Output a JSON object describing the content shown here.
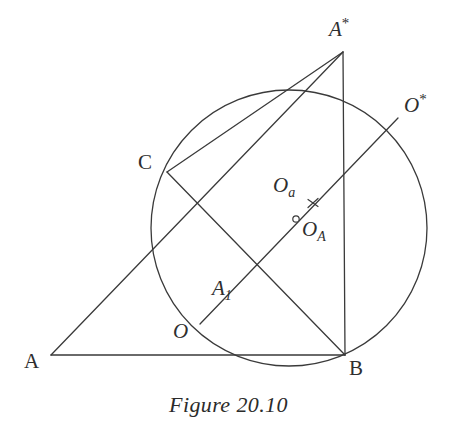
{
  "figure": {
    "caption": "Figure 20.10",
    "stroke_color": "#3a3a3a",
    "label_color": "#2e2e2e",
    "background_color": "#ffffff",
    "stroke_width": 1.3
  },
  "labels": {
    "A": "A",
    "B": "B",
    "C": "C",
    "O": "O",
    "A1_base": "A",
    "A1_sub": "1",
    "A_star_base": "A",
    "A_star_sup": "*",
    "O_star_base": "O",
    "O_star_sup": "*",
    "Oa_base": "O",
    "Oa_sub": "a",
    "OA_base": "O",
    "OA_sub": "A"
  },
  "geometry": {
    "circle": {
      "cx": 289,
      "cy": 228,
      "r": 138
    },
    "points": {
      "A": {
        "x": 51,
        "y": 355
      },
      "B": {
        "x": 345,
        "y": 355
      },
      "C": {
        "x": 167,
        "y": 172
      },
      "A_star": {
        "x": 343,
        "y": 52
      },
      "O": {
        "x": 200,
        "y": 324
      },
      "O_star": {
        "x": 398,
        "y": 118
      },
      "A1": {
        "x": 258,
        "y": 265
      },
      "Oa_mark": {
        "x": 313,
        "y": 203
      },
      "OA_mark": {
        "x": 296,
        "y": 219
      },
      "arc_top": {
        "x": 302,
        "y": 77
      }
    },
    "segments": [
      {
        "name": "side-AB",
        "from": "A",
        "to": "B"
      },
      {
        "name": "side-A-to-Astar",
        "from": "A",
        "to": "A_star"
      },
      {
        "name": "side-Astar-to-B",
        "from": "A_star",
        "to": "B"
      },
      {
        "name": "chord-C-to-Astar",
        "from": "C",
        "to": "A_star"
      },
      {
        "name": "segment-C-to-B",
        "from": "C",
        "to": "B"
      },
      {
        "name": "segment-O-to-Ostar",
        "from": "O",
        "to": "O_star"
      }
    ]
  }
}
